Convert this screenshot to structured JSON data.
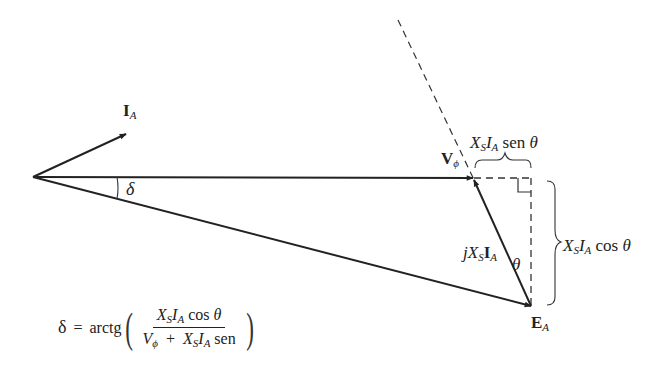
{
  "diagram": {
    "type": "phasor-diagram",
    "colors": {
      "line": "#222222",
      "background": "#ffffff"
    },
    "phasors": [
      {
        "name": "I_A",
        "label_main": "I",
        "label_sub": "A",
        "from": [
          33,
          177
        ],
        "to": [
          126,
          134
        ]
      },
      {
        "name": "V_phi",
        "label_main": "V",
        "label_sub": "ϕ",
        "from": [
          33,
          177
        ],
        "to": [
          473,
          178
        ]
      },
      {
        "name": "E_A",
        "label_main": "E",
        "label_sub": "A",
        "from": [
          33,
          177
        ],
        "to": [
          531,
          306
        ]
      },
      {
        "name": "jXsIA",
        "label_prefix": "j",
        "label_x": "X",
        "label_xsub": "S",
        "label_main": "I",
        "label_sub": "A",
        "from": [
          531,
          306
        ],
        "to": [
          473,
          178
        ]
      }
    ],
    "angles": {
      "delta": "δ",
      "theta": "θ"
    },
    "brace_labels": {
      "horizontal": {
        "x": "X",
        "xsub": "S",
        "i": "I",
        "isub": "A",
        "func": "sen",
        "arg": "θ"
      },
      "vertical": {
        "x": "X",
        "xsub": "S",
        "i": "I",
        "isub": "A",
        "func": "cos",
        "arg": "θ"
      }
    },
    "formula": {
      "lhs": "δ",
      "eq": "=",
      "func": "arctg",
      "numerator": {
        "x": "X",
        "xsub": "S",
        "i": "I",
        "isub": "A",
        "func": "cos",
        "arg": "θ"
      },
      "denominator": {
        "v": "V",
        "vsub": "ϕ",
        "plus": "+",
        "x": "X",
        "xsub": "S",
        "i": "I",
        "isub": "A",
        "func": "sen"
      }
    }
  }
}
